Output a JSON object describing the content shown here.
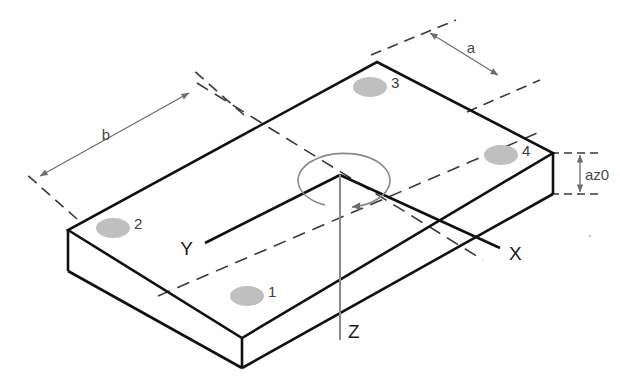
{
  "diagram": {
    "background_color": "#ffffff",
    "outline_color": "#111111",
    "dimension_color": "#6e6e6e",
    "centerline_color": "#3a3a3a",
    "axis_color": "#111111",
    "z_axis_color": "#8a8a8a",
    "marker_fill": "#bfbfbf",
    "marker_text_color": "#3c3c3c"
  },
  "axes": {
    "x": {
      "label": "X"
    },
    "y": {
      "label": "Y"
    },
    "z": {
      "label": "Z"
    }
  },
  "rotation": {
    "name": "yaw-rotation-arc",
    "direction": "counterclockwise",
    "about": "Z"
  },
  "dimensions": {
    "a": {
      "label": "a",
      "description": "short side length"
    },
    "b": {
      "label": "b",
      "description": "long side length"
    },
    "az0": {
      "label": "az0",
      "description": "slab thickness"
    }
  },
  "markers": [
    {
      "id": "1",
      "label": "1"
    },
    {
      "id": "2",
      "label": "2"
    },
    {
      "id": "3",
      "label": "3"
    },
    {
      "id": "4",
      "label": "4"
    }
  ]
}
